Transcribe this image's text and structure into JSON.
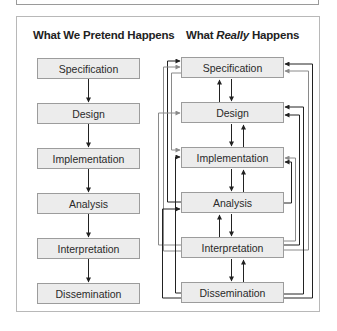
{
  "left_diagram": {
    "title": "What We Pretend Happens",
    "steps": [
      "Specification",
      "Design",
      "Implementation",
      "Analysis",
      "Interpretation",
      "Dissemination"
    ]
  },
  "right_diagram": {
    "title_prefix": "What ",
    "title_emphasis": "Really",
    "title_suffix": " Happens",
    "steps": [
      "Specification",
      "Design",
      "Implementation",
      "Analysis",
      "Interpretation",
      "Dissemination"
    ]
  },
  "colors": {
    "box_fill": "#ececec",
    "box_border": "#9c9c9c",
    "arrow_dark": "#222222",
    "arrow_gray": "#8a8a8a"
  }
}
